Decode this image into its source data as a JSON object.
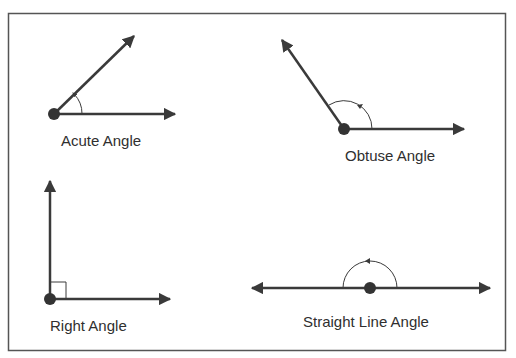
{
  "diagram": {
    "colors": {
      "line": "#3a3a3a",
      "border": "#555555",
      "background": "#ffffff"
    },
    "panels": [
      {
        "id": "acute",
        "label": "Acute Angle"
      },
      {
        "id": "obtuse",
        "label": "Obtuse Angle"
      },
      {
        "id": "right",
        "label": "Right Angle"
      },
      {
        "id": "straight",
        "label": "Straight Line Angle"
      }
    ]
  }
}
